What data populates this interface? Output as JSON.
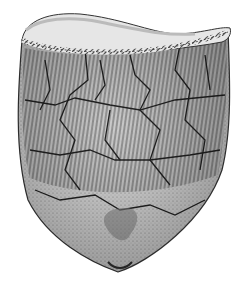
{
  "image": {
    "subject": "pottery-vessel-illustration",
    "description": "Stippled line drawing of a reconstructed cord-marked pot assembled from sherds",
    "colors": {
      "background": "#ffffff",
      "ink": "#2a2a2a",
      "mid_tone": "#9a9a9a",
      "light_tone": "#d6d6d6"
    }
  }
}
